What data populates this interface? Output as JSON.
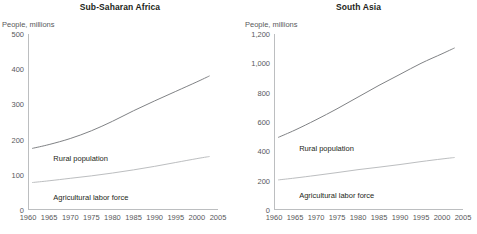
{
  "figure": {
    "background": "#ffffff",
    "text_color": "#231f20",
    "tick_color": "#58595b"
  },
  "chart_data": [
    {
      "type": "line",
      "title": "Sub-Saharan Africa",
      "ylabel": "People, millions",
      "xlabel": "",
      "xlim": [
        1960,
        2005
      ],
      "ylim": [
        0,
        500
      ],
      "yticks": [
        0,
        100,
        200,
        300,
        400,
        500
      ],
      "ytick_labels": [
        "0",
        "100",
        "200",
        "300",
        "400",
        "500"
      ],
      "xticks": [
        1960,
        1965,
        1970,
        1975,
        1980,
        1985,
        1990,
        1995,
        2000,
        2005
      ],
      "xtick_labels": [
        "1960",
        "1965",
        "1970",
        "1975",
        "1980",
        "1985",
        "1990",
        "1995",
        "2000",
        "2005"
      ],
      "grid": false,
      "legend": "inline-annotations",
      "series": [
        {
          "name": "Rural population",
          "color": "#808285",
          "x": [
            1961,
            1965,
            1970,
            1975,
            1980,
            1985,
            1990,
            1995,
            2000,
            2003
          ],
          "values": [
            175,
            186,
            203,
            225,
            252,
            282,
            310,
            337,
            364,
            381
          ]
        },
        {
          "name": "Agricultural labor force",
          "color": "#bcbec0",
          "x": [
            1961,
            1965,
            1970,
            1975,
            1980,
            1985,
            1990,
            1995,
            2000,
            2003
          ],
          "values": [
            78,
            83,
            90,
            97,
            105,
            114,
            124,
            135,
            146,
            152
          ]
        }
      ],
      "annotations": [
        {
          "text": "Rural population",
          "x": 1966,
          "y": 158
        },
        {
          "text": "Agricultural labor force",
          "x": 1966,
          "y": 48
        }
      ]
    },
    {
      "type": "line",
      "title": "South Asia",
      "ylabel": "People, millions",
      "xlabel": "",
      "xlim": [
        1960,
        2005
      ],
      "ylim": [
        0,
        1200
      ],
      "yticks": [
        0,
        200,
        400,
        600,
        800,
        1000,
        1200
      ],
      "ytick_labels": [
        "0",
        "200",
        "400",
        "600",
        "800",
        "1,000",
        "1,200"
      ],
      "xticks": [
        1960,
        1965,
        1970,
        1975,
        1980,
        1985,
        1990,
        1995,
        2000,
        2005
      ],
      "xtick_labels": [
        "1960",
        "1965",
        "1970",
        "1975",
        "1980",
        "1985",
        "1990",
        "1995",
        "2000",
        "2005"
      ],
      "grid": false,
      "legend": "inline-annotations",
      "series": [
        {
          "name": "Rural population",
          "color": "#808285",
          "x": [
            1961,
            1965,
            1970,
            1975,
            1980,
            1985,
            1990,
            1995,
            2000,
            2003
          ],
          "values": [
            495,
            545,
            615,
            690,
            770,
            850,
            925,
            1000,
            1065,
            1105
          ]
        },
        {
          "name": "Agricultural labor force",
          "color": "#bcbec0",
          "x": [
            1961,
            1965,
            1970,
            1975,
            1980,
            1985,
            1990,
            1995,
            2000,
            2003
          ],
          "values": [
            205,
            218,
            236,
            255,
            275,
            292,
            310,
            330,
            348,
            358
          ]
        }
      ],
      "annotations": [
        {
          "text": "Rural population",
          "x": 1966,
          "y": 448
        },
        {
          "text": "Agricultural labor force",
          "x": 1966,
          "y": 132
        }
      ]
    }
  ]
}
